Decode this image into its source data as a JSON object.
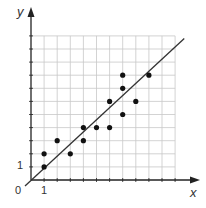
{
  "chart_data": {
    "type": "scatter",
    "title": "",
    "xlabel": "x",
    "ylabel": "y",
    "origin_label": "0",
    "x_tick_labels": [
      {
        "value": 1,
        "label": "1"
      }
    ],
    "y_tick_labels": [
      {
        "value": 1,
        "label": "1"
      }
    ],
    "xlim": [
      0,
      11
    ],
    "ylim": [
      0,
      11
    ],
    "grid": true,
    "legend": null,
    "points": [
      {
        "x": 1,
        "y": 1
      },
      {
        "x": 1,
        "y": 2
      },
      {
        "x": 2,
        "y": 3
      },
      {
        "x": 3,
        "y": 2
      },
      {
        "x": 4,
        "y": 3
      },
      {
        "x": 4,
        "y": 4
      },
      {
        "x": 5,
        "y": 4
      },
      {
        "x": 6,
        "y": 4
      },
      {
        "x": 6,
        "y": 6
      },
      {
        "x": 7,
        "y": 5
      },
      {
        "x": 7,
        "y": 7
      },
      {
        "x": 7,
        "y": 8
      },
      {
        "x": 8,
        "y": 6
      },
      {
        "x": 9,
        "y": 8
      }
    ],
    "trend_line": {
      "x0": 0,
      "y0": 0,
      "x1": 11.7,
      "y1": 10.8,
      "description": "line of best fit through origin"
    }
  },
  "colors": {
    "grid": "#c8c8c8",
    "axis": "#222222",
    "points": "#111111",
    "line": "#333333"
  }
}
